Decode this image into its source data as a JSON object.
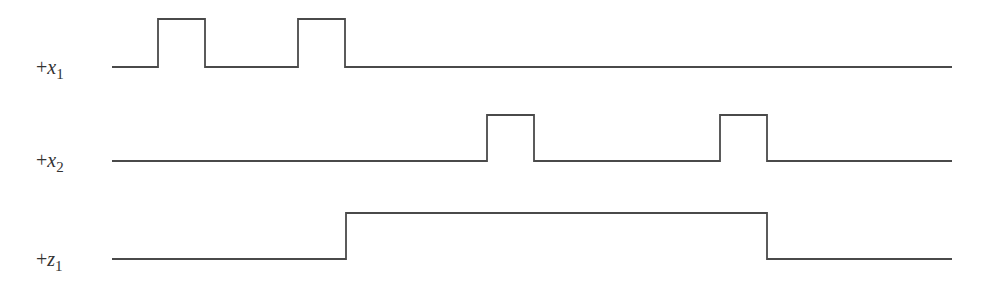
{
  "diagram": {
    "type": "timing",
    "signals": [
      {
        "id": "x1",
        "prefix": "+",
        "name": "x",
        "subscript": "1",
        "initial": 0,
        "transitions_t": [
          158,
          205,
          298,
          345
        ]
      },
      {
        "id": "x2",
        "prefix": "+",
        "name": "x",
        "subscript": "2",
        "initial": 0,
        "transitions_t": [
          487,
          534,
          720,
          767
        ]
      },
      {
        "id": "z1",
        "prefix": "+",
        "name": "z",
        "subscript": "1",
        "initial": 0,
        "transitions_t": [
          346,
          767
        ]
      }
    ],
    "time_range": [
      112,
      952
    ]
  }
}
